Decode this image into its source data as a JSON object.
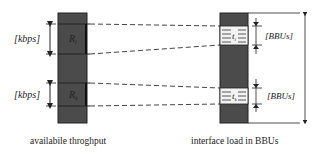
{
  "diagram": {
    "left_bar": {
      "caption": "availabile throghput",
      "segments": [
        {
          "label_main": "R",
          "label_sub": "i",
          "unit": "[kbps]"
        },
        {
          "label_main": "R",
          "label_sub": "k",
          "unit": "[kbps]"
        }
      ]
    },
    "right_bar": {
      "caption": "interface load in BBUs",
      "segments": [
        {
          "label_main": "t",
          "label_sub": "i",
          "unit": "[BBUs]"
        },
        {
          "label_main": "t",
          "label_sub": "k",
          "unit": "[BBUs]"
        }
      ]
    },
    "colors": {
      "bar_fill": "#4b4b4b",
      "segment_light": "#f2f2f2",
      "line": "#222222"
    }
  }
}
